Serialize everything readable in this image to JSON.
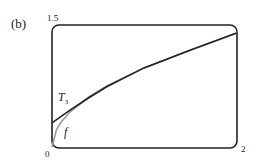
{
  "figure": {
    "panel_label": "(b)",
    "ticks": {
      "y_max": "1.5",
      "origin": "0",
      "x_max": "2"
    },
    "labels": {
      "t3_main": "T",
      "t3_sub": "3",
      "f": "f"
    }
  },
  "chart_data": {
    "type": "line",
    "title": "",
    "xlabel": "",
    "ylabel": "",
    "xlim": [
      0,
      2
    ],
    "ylim": [
      0,
      1.5
    ],
    "grid": false,
    "series": [
      {
        "name": "f",
        "color": "#9a9a9a",
        "x": [
          0,
          0.05,
          0.1,
          0.2,
          0.4,
          0.6,
          1.0,
          1.5,
          2.0
        ],
        "y": [
          0,
          0.22,
          0.31,
          0.44,
          0.62,
          0.76,
          0.98,
          1.2,
          1.41
        ]
      },
      {
        "name": "T_3",
        "color": "#222222",
        "x": [
          0,
          0.2,
          0.4,
          0.6,
          1.0,
          1.5,
          2.0
        ],
        "y": [
          0.3,
          0.46,
          0.61,
          0.75,
          0.98,
          1.2,
          1.41
        ]
      }
    ]
  }
}
